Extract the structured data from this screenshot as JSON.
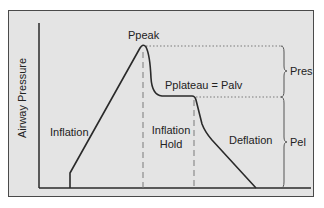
{
  "diagram": {
    "y_axis_label": "Airway Pressure",
    "labels": {
      "peak": "Ppeak",
      "plateau": "Pplateau = Palv",
      "inflation": "Inflation",
      "inflation_hold_line1": "Inflation",
      "inflation_hold_line2": "Hold",
      "deflation": "Deflation",
      "pres": "Pres",
      "pel": "Pel"
    },
    "colors": {
      "background": "#e4e4e4",
      "curve": "#2a2a2a",
      "axis": "#2a2a2a",
      "guide": "#7a7a7a"
    }
  }
}
